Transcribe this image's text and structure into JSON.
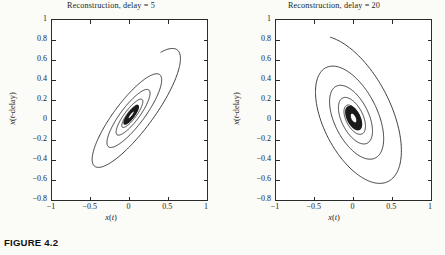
{
  "figure": {
    "caption": "FIGURE 4.2",
    "background_color": "#fbfbf8",
    "axis_color": "#2b2b2b",
    "curve_color": "#1a1a1a"
  },
  "panels": [
    {
      "title": "Reconstruction, delay = 5",
      "xlabel": "x(t)",
      "ylabel": "x(t-delay)",
      "xticks": [
        "-1",
        "-0.5",
        "0",
        "0.5",
        "1"
      ],
      "yticks": [
        "1",
        "0.8",
        "0.6",
        "0.4",
        "0.2",
        "0",
        "-0.2",
        "-0.4",
        "-0.6",
        "-0.8"
      ]
    },
    {
      "title": "Reconstruction, delay = 20",
      "xlabel": "x(t)",
      "ylabel": "x(t-delay)",
      "xticks": [
        "-1",
        "-0.5",
        "0",
        "0.5",
        "1"
      ],
      "yticks": [
        "1",
        "0.8",
        "0.6",
        "0.4",
        "0.2",
        "0",
        "-0.2",
        "-0.4",
        "-0.6",
        "-0.8"
      ]
    }
  ],
  "chart_data": [
    {
      "type": "line",
      "title": "Reconstruction, delay = 5",
      "xlabel": "x(t)",
      "ylabel": "x(t-delay)",
      "xlim": [
        -1,
        1
      ],
      "ylim": [
        -0.8,
        1
      ],
      "xticks": [
        -1,
        -0.5,
        0,
        0.5,
        1
      ],
      "yticks": [
        1,
        0.8,
        0.6,
        0.4,
        0.2,
        0,
        -0.2,
        -0.4,
        -0.6,
        -0.8
      ],
      "grid": false,
      "legend": false,
      "description": "Inward decaying spiral trajectory of a delay-embedded oscillator, major axis tilted about +45 degrees (strong positive correlation between x(t) and x(t-delay)); narrow elongated loops converging to a dense dark core near the origin.",
      "spiral": {
        "center_x": 0.02,
        "center_y": 0.05,
        "tilt_deg": 45,
        "major_start": 0.93,
        "minor_start": 0.27,
        "decay_per_turn": 0.62,
        "turns": 5.6,
        "start_angle_deg": 40,
        "direction": "clockwise"
      },
      "outer_extent": {
        "x_min": -0.78,
        "x_max": 0.86,
        "y_min": -0.79,
        "y_max": 0.92
      }
    },
    {
      "type": "line",
      "title": "Reconstruction, delay = 20",
      "xlabel": "x(t)",
      "ylabel": "x(t-delay)",
      "xlim": [
        -1,
        1
      ],
      "ylim": [
        -0.8,
        1
      ],
      "xticks": [
        -1,
        -0.5,
        0,
        0.5,
        1
      ],
      "yticks": [
        1,
        0.8,
        0.6,
        0.4,
        0.2,
        0,
        -0.2,
        -0.4,
        -0.6,
        -0.8
      ],
      "grid": false,
      "legend": false,
      "description": "Inward decaying spiral trajectory of the same oscillator embedded with a longer delay; loops are broader and rounder with the major axis tilted about -50 degrees (negative correlation), converging to a dense dark core just above the origin.",
      "spiral": {
        "center_x": 0.0,
        "center_y": 0.02,
        "tilt_deg": -52,
        "major_start": 0.95,
        "minor_start": 0.52,
        "decay_per_turn": 0.63,
        "turns": 5.4,
        "start_angle_deg": 150,
        "direction": "clockwise"
      },
      "outer_extent": {
        "x_min": -0.93,
        "x_max": 0.72,
        "y_min": -0.8,
        "y_max": 0.93
      }
    }
  ]
}
